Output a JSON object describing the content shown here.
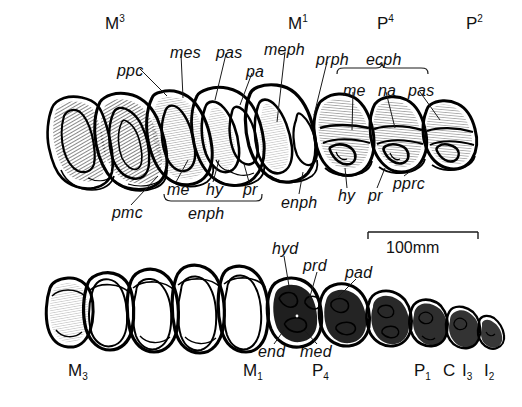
{
  "figure": {
    "background_color": "#ffffff",
    "ink_color": "#000000"
  },
  "scale_bar": {
    "label": "100mm",
    "x1": 368,
    "x2": 478,
    "y": 232
  },
  "upper_row": {
    "tooth_positions": [
      {
        "name": "M3",
        "base": "M",
        "index": "3",
        "index_type": "superscript",
        "x": 105,
        "y": 22
      },
      {
        "name": "M1",
        "base": "M",
        "index": "1",
        "index_type": "superscript",
        "x": 288,
        "y": 22
      },
      {
        "name": "P4",
        "base": "P",
        "index": "4",
        "index_type": "superscript",
        "x": 377,
        "y": 22
      },
      {
        "name": "P2",
        "base": "P",
        "index": "2",
        "index_type": "superscript",
        "x": 466,
        "y": 22
      }
    ],
    "labels_above": [
      {
        "name": "ppc",
        "text": "ppc",
        "x": 117,
        "y": 63
      },
      {
        "name": "mes",
        "text": "mes",
        "x": 170,
        "y": 45
      },
      {
        "name": "pas",
        "text": "pas",
        "x": 216,
        "y": 45
      },
      {
        "name": "pa",
        "text": "pa",
        "x": 246,
        "y": 64
      },
      {
        "name": "meph",
        "text": "meph",
        "x": 264,
        "y": 42
      },
      {
        "name": "prph",
        "text": "prph",
        "x": 316,
        "y": 52
      },
      {
        "name": "ecph",
        "text": "ecph",
        "x": 366,
        "y": 52
      },
      {
        "name": "me",
        "text": "me",
        "x": 343,
        "y": 83
      },
      {
        "name": "na",
        "text": "na",
        "x": 378,
        "y": 83
      },
      {
        "name": "pas2",
        "text": "pas",
        "x": 408,
        "y": 83
      }
    ],
    "labels_below": [
      {
        "name": "pmc",
        "text": "pmc",
        "x": 112,
        "y": 212
      },
      {
        "name": "me",
        "text": "me",
        "x": 167,
        "y": 191
      },
      {
        "name": "hy",
        "text": "hy",
        "x": 206,
        "y": 191
      },
      {
        "name": "pr",
        "text": "pr",
        "x": 243,
        "y": 191
      },
      {
        "name": "enph",
        "text": "enph",
        "x": 188,
        "y": 215
      },
      {
        "name": "enph2",
        "text": "enph",
        "x": 290,
        "y": 203
      },
      {
        "name": "hy2",
        "text": "hy",
        "x": 341,
        "y": 196
      },
      {
        "name": "pr2",
        "text": "pr",
        "x": 371,
        "y": 196
      },
      {
        "name": "pprc",
        "text": "pprc",
        "x": 396,
        "y": 184
      }
    ],
    "brackets": [
      {
        "name": "ecph-bracket",
        "x1": 337,
        "x2": 428,
        "y": 70,
        "direction": "up"
      },
      {
        "name": "enph-bracket",
        "x1": 164,
        "x2": 262,
        "y": 200,
        "direction": "down"
      }
    ]
  },
  "lower_row": {
    "tooth_positions": [
      {
        "name": "M3",
        "base": "M",
        "index": "3",
        "index_type": "subscript",
        "x": 68,
        "y": 366
      },
      {
        "name": "M1",
        "base": "M",
        "index": "1",
        "index_type": "subscript",
        "x": 243,
        "y": 366
      },
      {
        "name": "P4",
        "base": "P",
        "index": "4",
        "index_type": "subscript",
        "x": 312,
        "y": 366
      },
      {
        "name": "P1",
        "base": "P",
        "index": "1",
        "index_type": "subscript",
        "x": 414,
        "y": 366
      },
      {
        "name": "C",
        "base": "C",
        "index": "",
        "index_type": "none",
        "x": 443,
        "y": 366
      },
      {
        "name": "I3",
        "base": "I",
        "index": "3",
        "index_type": "subscript",
        "x": 462,
        "y": 366
      },
      {
        "name": "I2",
        "base": "I",
        "index": "2",
        "index_type": "subscript",
        "x": 484,
        "y": 366
      }
    ],
    "labels_above": [
      {
        "name": "hyd",
        "text": "hyd",
        "x": 272,
        "y": 249
      },
      {
        "name": "prd",
        "text": "prd",
        "x": 307,
        "y": 265
      },
      {
        "name": "pad",
        "text": "pad",
        "x": 348,
        "y": 272
      }
    ],
    "labels_below": [
      {
        "name": "end",
        "text": "end",
        "x": 262,
        "y": 351
      },
      {
        "name": "med",
        "text": "med",
        "x": 305,
        "y": 351
      }
    ]
  }
}
